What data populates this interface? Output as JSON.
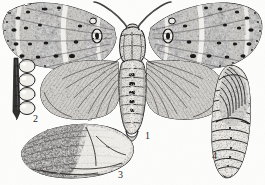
{
  "plate": {
    "kind": "scientific-illustration",
    "technique": "engraving / stipple line drawing",
    "background_color": "#fdfdfc",
    "ink_color": "#1c1c1c",
    "width": 265,
    "height": 185,
    "subject": "moth life history plate",
    "figures": [
      {
        "number": "1",
        "name": "adult-moth",
        "description": "adult moth with wings spread, mottled dark and pale banded forewings, plain grey hindwings, segmented abdomen, paired antennae"
      },
      {
        "number": "2",
        "name": "egg-cluster",
        "description": "column of four oval eggs attached along a dark vertical twig",
        "egg_count": 4
      },
      {
        "number": "3",
        "name": "cocoon",
        "description": "elongated oval silk cocoon, dark stippled at left, pale at right"
      },
      {
        "number": "4",
        "name": "pupa",
        "description": "chrysalis seen from the side, dark striated wing cases above, ringed abdominal segments with spiracle dots below"
      }
    ]
  },
  "labels": {
    "one": "1",
    "two": "2",
    "three": "3",
    "four": "4"
  },
  "colors": {
    "ink": "#1c1c1c",
    "mid_grey": "#6e6e6e",
    "light_grey": "#b9b9b9",
    "paper": "#fdfdfc"
  }
}
